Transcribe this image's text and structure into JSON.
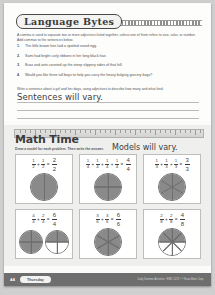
{
  "language_section": {
    "title": "Language Bytes",
    "intro": "A comma is used to separate two or more adjectives listed together, unless one of them refers to size, color, or number. Add commas to the sentences below.",
    "questions": [
      {
        "num": "1.",
        "text": "The little brown hen laid a spotted round egg."
      },
      {
        "num": "2.",
        "text": "Sami had bright curly ribbons in her long black hair."
      },
      {
        "num": "3.",
        "text": "Buzz and ants counted up the steep slippery sides of that hill."
      },
      {
        "num": "4.",
        "text": "Would you like three tall boys to help you carry the heavy bulging grocery bags?"
      }
    ],
    "prompt": "Write a sentence about a girl and her dogs, using adjectives to describe how many and what kind.",
    "answer": "Sentences will vary."
  },
  "math_section": {
    "title": "Math Time",
    "directions": "Draw a model for each problem. Then write the answer.",
    "note": "Models will vary.",
    "problems": [
      {
        "terms": [
          "1/2",
          "1/2"
        ],
        "answer_num": "2",
        "answer_den": "2",
        "parts": 2,
        "shaded": 2,
        "circles": 1
      },
      {
        "terms": [
          "1/4",
          "1/4",
          "1/4",
          "1/4"
        ],
        "answer_num": "4",
        "answer_den": "4",
        "parts": 4,
        "shaded": 4,
        "circles": 1
      },
      {
        "terms": [
          "1/3",
          "1/3",
          "1/3"
        ],
        "answer_num": "3",
        "answer_den": "3",
        "parts": 3,
        "shaded": 3,
        "circles": 1
      },
      {
        "terms": [
          "4/4",
          "2/4"
        ],
        "answer_num": "6",
        "answer_den": "4",
        "parts": 4,
        "shaded": 6,
        "circles": 2
      },
      {
        "terms": [
          "3/6",
          "3/6"
        ],
        "answer_num": "6",
        "answer_den": "6",
        "parts": 6,
        "shaded": 6,
        "circles": 1
      },
      {
        "terms": [
          "2/8",
          "2/8"
        ],
        "answer_num": "4",
        "answer_den": "8",
        "parts": 8,
        "shaded": 4,
        "circles": 1
      }
    ]
  },
  "footer": {
    "page": "44",
    "day_label": "Thursday",
    "credit": "Daily Summer Activities • EMC 1072 • © Evan-Moor Corp."
  },
  "colors": {
    "page_bg": "#fbfbfa",
    "math_bg": "#efefee",
    "footer_bg": "#6e6e6e",
    "shade": "#8a8a8a",
    "ink": "#3c3c3c"
  }
}
